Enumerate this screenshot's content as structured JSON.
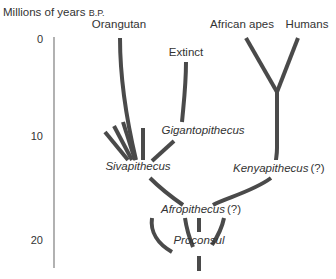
{
  "diagram": {
    "title": "Millions of years",
    "title_suffix": "B.P.",
    "axis": {
      "ticks": [
        {
          "label": "0"
        },
        {
          "label": "10"
        },
        {
          "label": "20"
        }
      ]
    },
    "labels": {
      "orangutan": "Orangutan",
      "extinct": "Extinct",
      "african_apes": "African apes",
      "humans": "Humans",
      "gigantopithecus": "Gigantopithecus",
      "sivapithecus": "Sivapithecus",
      "kenyapithecus": "Kenyapithecus",
      "kenyapithecus_q": "(?)",
      "afropithecus": "Afropithecus",
      "afropithecus_q": "(?)",
      "proconsul": "Proconsul"
    },
    "colors": {
      "branch": "#4a4a4a",
      "axis": "#888888",
      "text": "#333333"
    }
  }
}
